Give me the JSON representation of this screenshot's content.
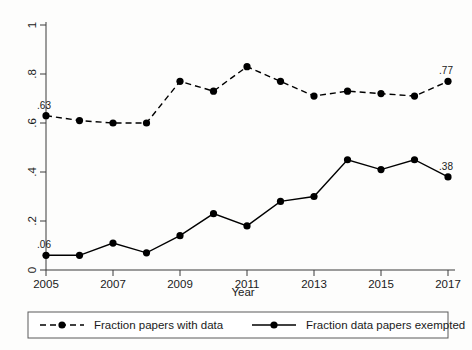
{
  "chart_data": {
    "type": "line",
    "title": "",
    "xlabel": "Year",
    "ylabel": "",
    "x": [
      2005,
      2006,
      2007,
      2008,
      2009,
      2010,
      2011,
      2012,
      2013,
      2014,
      2015,
      2016,
      2017
    ],
    "xlim": [
      2005,
      2017
    ],
    "ylim": [
      0,
      1
    ],
    "grid": false,
    "legend_position": "bottom",
    "xticks": [
      "2005",
      "2007",
      "2009",
      "2011",
      "2013",
      "2015",
      "2017"
    ],
    "xtick_values": [
      2005,
      2007,
      2009,
      2011,
      2013,
      2015,
      2017
    ],
    "yticks": [
      "0",
      ".2",
      ".4",
      ".6",
      ".8",
      "1"
    ],
    "ytick_values": [
      0,
      0.2,
      0.4,
      0.6,
      0.8,
      1
    ],
    "series": [
      {
        "name": "Fraction papers with data",
        "style": "dashed",
        "marker": "circle",
        "values": [
          0.63,
          0.61,
          0.6,
          0.6,
          0.77,
          0.73,
          0.83,
          0.77,
          0.71,
          0.73,
          0.72,
          0.71,
          0.77
        ],
        "annotations": [
          {
            "x": 2005,
            "y": 0.63,
            "text": ".63"
          },
          {
            "x": 2017,
            "y": 0.77,
            "text": ".77"
          }
        ]
      },
      {
        "name": "Fraction data papers exempted",
        "style": "solid",
        "marker": "circle",
        "values": [
          0.06,
          0.06,
          0.11,
          0.07,
          0.14,
          0.23,
          0.18,
          0.28,
          0.3,
          0.45,
          0.41,
          0.45,
          0.38
        ],
        "annotations": [
          {
            "x": 2005,
            "y": 0.06,
            "text": ".06"
          },
          {
            "x": 2017,
            "y": 0.38,
            "text": ".38"
          }
        ]
      }
    ]
  },
  "axes": {
    "x_title": "Year",
    "y_title": ""
  },
  "legend": {
    "entries": [
      {
        "label": "Fraction papers with data",
        "style": "dashed"
      },
      {
        "label": "Fraction data papers exempted",
        "style": "solid"
      }
    ]
  },
  "colors": {
    "line": "#000000",
    "axis": "#3a3a3a",
    "background": "#fdfdfc",
    "legend_border": "#5a5a5a"
  }
}
